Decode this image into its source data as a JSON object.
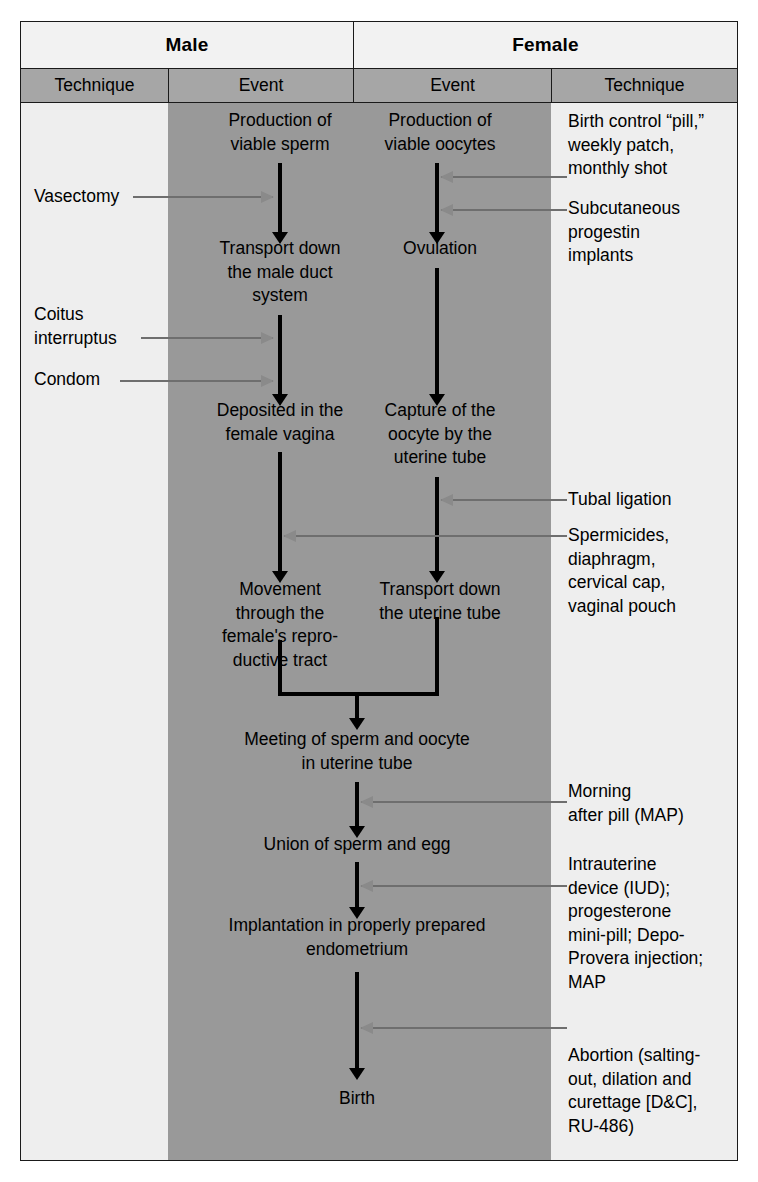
{
  "diagram": {
    "colors": {
      "band": "#999999",
      "header_top": "#f2f2f2",
      "header_sub": "#a6a6a6",
      "page_bg": "#eeeeee",
      "flow_arrow": "#000000",
      "pointer_arrow": "#8a8a8a"
    },
    "headers": {
      "top": [
        {
          "label": "Male"
        },
        {
          "label": "Female"
        }
      ],
      "sub": [
        {
          "label": "Technique"
        },
        {
          "label": "Event"
        },
        {
          "label": "Event"
        },
        {
          "label": "Technique"
        }
      ]
    },
    "male_events": [
      {
        "id": "m1",
        "label": "Production of\nviable sperm"
      },
      {
        "id": "m2",
        "label": "Transport down\nthe  male duct\nsystem"
      },
      {
        "id": "m3",
        "label": "Deposited in the\nfemale vagina"
      },
      {
        "id": "m4",
        "label": "Movement\nthrough the\nfemale's repro-\nductive tract"
      }
    ],
    "female_events": [
      {
        "id": "f1",
        "label": "Production of\nviable oocytes"
      },
      {
        "id": "f2",
        "label": "Ovulation"
      },
      {
        "id": "f3",
        "label": "Capture of the\noocyte by the\nuterine tube"
      },
      {
        "id": "f4",
        "label": "Transport down\nthe uterine tube"
      }
    ],
    "shared_events": [
      {
        "id": "s1",
        "label": "Meeting of sperm and oocyte\nin uterine tube"
      },
      {
        "id": "s2",
        "label": "Union of sperm and egg"
      },
      {
        "id": "s3",
        "label": "Implantation in properly prepared\nendometrium"
      },
      {
        "id": "s4",
        "label": "Birth"
      }
    ],
    "male_techniques": [
      {
        "id": "mt1",
        "label": "Vasectomy"
      },
      {
        "id": "mt2",
        "label": "Coitus\ninterruptus"
      },
      {
        "id": "mt3",
        "label": "Condom"
      }
    ],
    "female_techniques": [
      {
        "id": "ft1",
        "label": "Birth control “pill,”\nweekly patch,\nmonthly shot"
      },
      {
        "id": "ft2",
        "label": "Subcutaneous\nprogestin\nimplants"
      },
      {
        "id": "ft3",
        "label": "Tubal ligation"
      },
      {
        "id": "ft4",
        "label": "Spermicides,\ndiaphragm,\ncervical cap,\nvaginal pouch"
      },
      {
        "id": "ft5",
        "label": "Morning\nafter pill (MAP)"
      },
      {
        "id": "ft6",
        "label": "Intrauterine\ndevice (IUD);\nprogesterone\nmini-pill; Depo-\nProvera injection;\nMAP"
      },
      {
        "id": "ft7",
        "label": "Abortion (salting-\nout, dilation and\ncurettage [D&C],\nRU-486)"
      }
    ]
  }
}
